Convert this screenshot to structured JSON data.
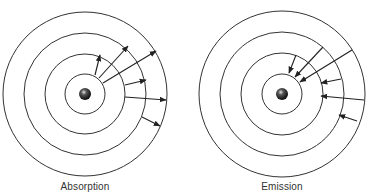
{
  "diagrams": [
    {
      "id": "absorption",
      "label": "Absorption",
      "center": [
        85,
        94
      ],
      "radii": [
        20,
        40,
        61,
        82
      ],
      "arrows": [
        {
          "from": [
            95,
            75
          ],
          "to": [
            100,
            55
          ]
        },
        {
          "from": [
            99,
            78
          ],
          "to": [
            128,
            46
          ]
        },
        {
          "from": [
            103,
            83
          ],
          "to": [
            156,
            51
          ]
        },
        {
          "from": [
            125,
            85
          ],
          "to": [
            146,
            80
          ]
        },
        {
          "from": [
            125,
            97
          ],
          "to": [
            166,
            100
          ]
        },
        {
          "from": [
            142,
            117
          ],
          "to": [
            160,
            126
          ]
        }
      ]
    },
    {
      "id": "emission",
      "label": "Emission",
      "center": [
        282,
        94
      ],
      "radii": [
        20,
        41,
        62,
        83
      ],
      "arrows": [
        {
          "from": [
            296,
            55
          ],
          "to": [
            289,
            73
          ]
        },
        {
          "from": [
            323,
            47
          ],
          "to": [
            295,
            77
          ]
        },
        {
          "from": [
            352,
            50
          ],
          "to": [
            300,
            82
          ]
        },
        {
          "from": [
            341,
            79
          ],
          "to": [
            321,
            83
          ]
        },
        {
          "from": [
            364,
            100
          ],
          "to": [
            321,
            96
          ]
        },
        {
          "from": [
            357,
            121
          ],
          "to": [
            339,
            115
          ]
        }
      ]
    }
  ],
  "colors": {
    "line": "#333333",
    "nucleus_dark": "#111111",
    "nucleus_highlight": "#cccccc"
  }
}
